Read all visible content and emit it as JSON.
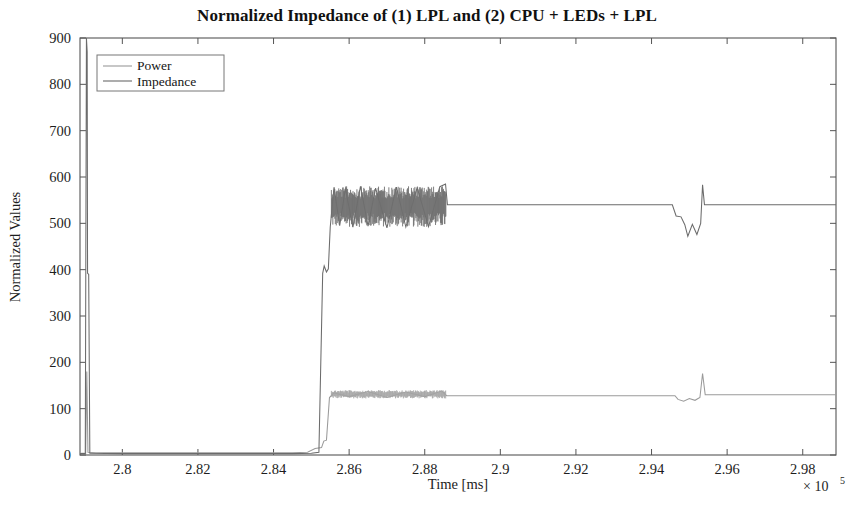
{
  "figure": {
    "title": "Normalized Impedance of (1) LPL and (2) CPU + LEDs + LPL",
    "background_color": "#ffffff",
    "axis_color": "#4a4a4a"
  },
  "legend": {
    "position": "top-left-inside",
    "entries": [
      {
        "label": "Power",
        "color": "#9a9a9a"
      },
      {
        "label": "Impedance",
        "color": "#6b6b6b"
      }
    ]
  },
  "axes": {
    "x": {
      "label": "Time [ms]",
      "exponent_label": "× 10",
      "exponent_power": "5",
      "ticks": [
        "2.8",
        "2.82",
        "2.84",
        "2.86",
        "2.88",
        "2.9",
        "2.92",
        "2.94",
        "2.96",
        "2.98"
      ],
      "tick_values": [
        2.8,
        2.82,
        2.84,
        2.86,
        2.88,
        2.9,
        2.92,
        2.94,
        2.96,
        2.98
      ],
      "min": 2.7888,
      "max": 2.9888
    },
    "y": {
      "label": "Normalized Values",
      "ticks": [
        "0",
        "100",
        "200",
        "300",
        "400",
        "500",
        "600",
        "700",
        "800",
        "900"
      ],
      "tick_values": [
        0,
        100,
        200,
        300,
        400,
        500,
        600,
        700,
        800,
        900
      ],
      "min": 0,
      "max": 900
    }
  },
  "chart_data": {
    "type": "line",
    "title": "Normalized Impedance of (1) LPL and (2) CPU + LEDs + LPL",
    "xlabel": "Time [ms]",
    "ylabel": "Normalized Values",
    "x_scale_multiplier": 100000,
    "xlim": [
      2.7888,
      2.9888
    ],
    "ylim": [
      0,
      900
    ],
    "grid": false,
    "legend_position": "upper left",
    "series": [
      {
        "name": "Power",
        "color": "#9a9a9a",
        "description": "Near zero at start, a narrow spike to ~180 at t=2.7907, flat near 5 until t=2.8535 where small steps raise it, then a noisy band oscillating between 122 and 140 from 2.8553 to 2.8857, then a flat line at ~128 until 2.9465 where small dips occur, a spike to ~175 at 2.9535, then flat at ~130 to the end",
        "points": [
          [
            2.7888,
            4
          ],
          [
            2.7903,
            4
          ],
          [
            2.7906,
            180
          ],
          [
            2.7909,
            6
          ],
          [
            2.793,
            5
          ],
          [
            2.81,
            5
          ],
          [
            2.83,
            5
          ],
          [
            2.845,
            5
          ],
          [
            2.849,
            6
          ],
          [
            2.851,
            14
          ],
          [
            2.8527,
            16
          ],
          [
            2.8533,
            30
          ],
          [
            2.854,
            32
          ],
          [
            2.8548,
            124
          ],
          [
            2.856,
            134
          ],
          [
            2.86,
            126
          ],
          [
            2.865,
            137
          ],
          [
            2.87,
            124
          ],
          [
            2.875,
            136
          ],
          [
            2.88,
            126
          ],
          [
            2.8845,
            138
          ],
          [
            2.8858,
            128
          ],
          [
            2.9,
            128
          ],
          [
            2.92,
            128
          ],
          [
            2.94,
            128
          ],
          [
            2.9462,
            128
          ],
          [
            2.947,
            120
          ],
          [
            2.9485,
            116
          ],
          [
            2.95,
            122
          ],
          [
            2.9515,
            118
          ],
          [
            2.9528,
            124
          ],
          [
            2.9535,
            176
          ],
          [
            2.9542,
            130
          ],
          [
            2.96,
            130
          ],
          [
            2.98,
            130
          ],
          [
            2.9888,
            130
          ]
        ]
      },
      {
        "name": "Impedance",
        "color": "#6b6b6b",
        "description": "Flat near zero, a tall spike to ~900 at t=2.7907 then a lower ledge near 390, flat near zero until 2.8535 where a step ladder rises near 400, then a dense oscillating band between 490 and 580 from 2.8553 to 2.8857, a spike to ~585 at 2.8860, then a steady plateau at ~540 until 2.9455, a descending staircase to ~500 then dips near 470, a spike to ~583 at 2.9535, then a flat plateau at ~540 to the end",
        "points": [
          [
            2.7888,
            3
          ],
          [
            2.7902,
            3
          ],
          [
            2.7905,
            900
          ],
          [
            2.7907,
            870
          ],
          [
            2.7908,
            392
          ],
          [
            2.7911,
            390
          ],
          [
            2.7914,
            4
          ],
          [
            2.8,
            3
          ],
          [
            2.83,
            3
          ],
          [
            2.845,
            3
          ],
          [
            2.85,
            4
          ],
          [
            2.852,
            6
          ],
          [
            2.853,
            392
          ],
          [
            2.8534,
            408
          ],
          [
            2.854,
            395
          ],
          [
            2.8545,
            402
          ],
          [
            2.855,
            492
          ],
          [
            2.856,
            578
          ],
          [
            2.8575,
            495
          ],
          [
            2.859,
            575
          ],
          [
            2.861,
            492
          ],
          [
            2.863,
            580
          ],
          [
            2.865,
            494
          ],
          [
            2.867,
            576
          ],
          [
            2.87,
            490
          ],
          [
            2.8725,
            578
          ],
          [
            2.875,
            492
          ],
          [
            2.878,
            577
          ],
          [
            2.881,
            493
          ],
          [
            2.884,
            579
          ],
          [
            2.8855,
            585
          ],
          [
            2.886,
            540
          ],
          [
            2.9,
            540
          ],
          [
            2.92,
            540
          ],
          [
            2.94,
            540
          ],
          [
            2.9455,
            540
          ],
          [
            2.9465,
            516
          ],
          [
            2.9478,
            514
          ],
          [
            2.9488,
            497
          ],
          [
            2.9496,
            472
          ],
          [
            2.9508,
            498
          ],
          [
            2.952,
            476
          ],
          [
            2.953,
            500
          ],
          [
            2.9535,
            583
          ],
          [
            2.954,
            540
          ],
          [
            2.97,
            540
          ],
          [
            2.9888,
            540
          ]
        ]
      }
    ]
  }
}
